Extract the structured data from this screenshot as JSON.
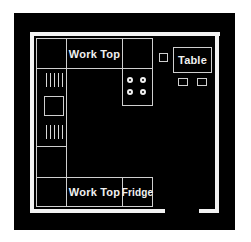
{
  "plan": {
    "title": "Kitchen floor plan",
    "colors": {
      "background": "#000000",
      "walls": "#f2f2f2",
      "lines": "#cfcfcf",
      "page": "#ffffff"
    },
    "labels": {
      "work_top_top": "Work Top",
      "work_top_bottom": "Work Top",
      "fridge": "Fridge",
      "table": "Table"
    },
    "icons": {
      "hob": "four-burner-hob-icon",
      "sink": "sink-with-drainers-icon",
      "chairs": "chair-icons",
      "door": "door-opening"
    }
  }
}
